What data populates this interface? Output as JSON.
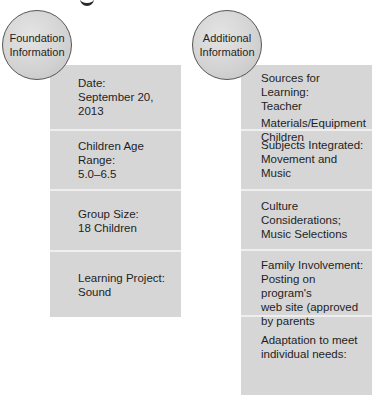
{
  "foundation": {
    "title_line1": "Foundation",
    "title_line2": "Information",
    "cells": [
      {
        "label": "Date:",
        "value": "September 20, 2013"
      },
      {
        "label": "Children Age Range:",
        "value": "5.0–6.5"
      },
      {
        "label": "Group Size:",
        "value": "18 Children"
      },
      {
        "label": "Learning Project:",
        "value": "Sound"
      }
    ]
  },
  "additional": {
    "title_line1": "Additional",
    "title_line2": "Information",
    "cells": [
      {
        "lines": [
          "Sources for Learning:",
          "Teacher",
          "Materials/Equipment",
          "Children"
        ]
      },
      {
        "lines": [
          "Subjects Integrated:",
          "Movement and",
          "Music"
        ]
      },
      {
        "lines": [
          "Culture Considerations;",
          "Music Selections"
        ]
      },
      {
        "lines": [
          "Family Involvement:",
          "Posting on program's",
          "web site (approved",
          "by parents"
        ]
      },
      {
        "lines": [
          "Adaptation to meet",
          "individual needs:"
        ]
      }
    ]
  }
}
